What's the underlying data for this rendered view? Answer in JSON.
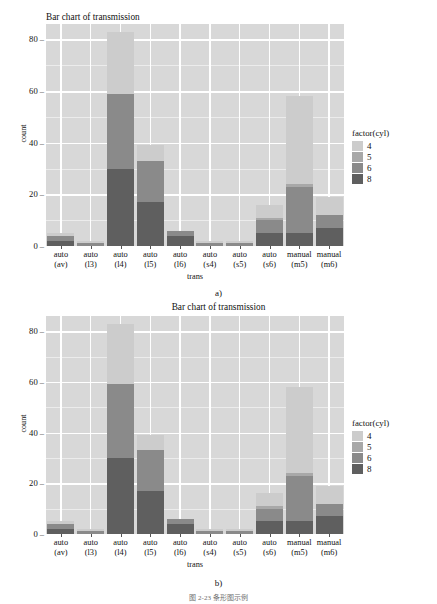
{
  "figure": {
    "panel_a_label": "a)",
    "panel_b_label": "b)",
    "caption": "图 2-23  条形图示例"
  },
  "colors": {
    "panel_background": "#d8d8d8",
    "gridline_major": "#ffffff",
    "gridline_minor": "#ececec",
    "cyl_4": "#cccccc",
    "cyl_5": "#a8a8a8",
    "cyl_6": "#8a8a8a",
    "cyl_8": "#5f5f5f",
    "text": "#111111"
  },
  "chart_data": [
    {
      "type": "bar",
      "id": "chart-a",
      "title": "Bar chart of transmission",
      "title_align": "left",
      "xlabel": "trans",
      "ylabel": "count",
      "ylim": [
        0,
        86
      ],
      "yticks": [
        0,
        20,
        40,
        60,
        80
      ],
      "ytick_labels": [
        "0",
        "20",
        "40",
        "60",
        "80"
      ],
      "grid": true,
      "stacked": true,
      "legend_title": "factor(cyl)",
      "legend_position": "right",
      "categories": [
        "auto\n(av)",
        "auto\n(l3)",
        "auto\n(l4)",
        "auto\n(l5)",
        "auto\n(l6)",
        "auto\n(s4)",
        "auto\n(s5)",
        "auto\n(s6)",
        "manual\n(m5)",
        "manual\n(m6)"
      ],
      "category_labels": [
        {
          "line1": "auto",
          "line2": "(av)"
        },
        {
          "line1": "auto",
          "line2": "(l3)"
        },
        {
          "line1": "auto",
          "line2": "(l4)"
        },
        {
          "line1": "auto",
          "line2": "(l5)"
        },
        {
          "line1": "auto",
          "line2": "(l6)"
        },
        {
          "line1": "auto",
          "line2": "(s4)"
        },
        {
          "line1": "auto",
          "line2": "(s5)"
        },
        {
          "line1": "auto",
          "line2": "(s6)"
        },
        {
          "line1": "manual",
          "line2": "(m5)"
        },
        {
          "line1": "manual",
          "line2": "(m6)"
        }
      ],
      "series": [
        {
          "name": "8",
          "color": "#5f5f5f",
          "values": [
            2,
            0,
            30,
            17,
            4,
            0,
            0,
            5,
            5,
            7
          ]
        },
        {
          "name": "6",
          "color": "#8a8a8a",
          "values": [
            2,
            1,
            29,
            16,
            2,
            1,
            1,
            5,
            18,
            5
          ]
        },
        {
          "name": "5",
          "color": "#a8a8a8",
          "values": [
            0,
            0,
            0,
            0,
            0,
            0,
            0,
            1,
            1,
            0
          ]
        },
        {
          "name": "4",
          "color": "#cccccc",
          "values": [
            1,
            1,
            24,
            6,
            0,
            1,
            1,
            5,
            34,
            7
          ]
        }
      ],
      "totals": [
        5,
        2,
        83,
        39,
        6,
        2,
        2,
        16,
        58,
        19
      ]
    },
    {
      "type": "bar",
      "id": "chart-b",
      "title": "Bar chart of transmission",
      "title_align": "center",
      "xlabel": "trans",
      "ylabel": "count",
      "ylim": [
        0,
        86
      ],
      "yticks": [
        0,
        20,
        40,
        60,
        80
      ],
      "ytick_labels": [
        "0",
        "20",
        "40",
        "60",
        "80"
      ],
      "grid": true,
      "stacked": true,
      "legend_title": "factor(cyl)",
      "legend_position": "right",
      "categories": [
        "auto\n(av)",
        "auto\n(l3)",
        "auto\n(l4)",
        "auto\n(l5)",
        "auto\n(l6)",
        "auto\n(s4)",
        "auto\n(s5)",
        "auto\n(s6)",
        "manual\n(m5)",
        "manual\n(m6)"
      ],
      "category_labels": [
        {
          "line1": "auto",
          "line2": "(av)"
        },
        {
          "line1": "auto",
          "line2": "(l3)"
        },
        {
          "line1": "auto",
          "line2": "(l4)"
        },
        {
          "line1": "auto",
          "line2": "(l5)"
        },
        {
          "line1": "auto",
          "line2": "(l6)"
        },
        {
          "line1": "auto",
          "line2": "(s4)"
        },
        {
          "line1": "auto",
          "line2": "(s5)"
        },
        {
          "line1": "auto",
          "line2": "(s6)"
        },
        {
          "line1": "manual",
          "line2": "(m5)"
        },
        {
          "line1": "manual",
          "line2": "(m6)"
        }
      ],
      "series": [
        {
          "name": "8",
          "color": "#5f5f5f",
          "values": [
            2,
            0,
            30,
            17,
            4,
            0,
            0,
            5,
            5,
            7
          ]
        },
        {
          "name": "6",
          "color": "#8a8a8a",
          "values": [
            2,
            1,
            29,
            16,
            2,
            1,
            1,
            5,
            18,
            5
          ]
        },
        {
          "name": "5",
          "color": "#a8a8a8",
          "values": [
            0,
            0,
            0,
            0,
            0,
            0,
            0,
            1,
            1,
            0
          ]
        },
        {
          "name": "4",
          "color": "#cccccc",
          "values": [
            1,
            1,
            24,
            6,
            0,
            1,
            1,
            5,
            34,
            7
          ]
        }
      ],
      "totals": [
        5,
        2,
        83,
        39,
        6,
        2,
        2,
        16,
        58,
        19
      ]
    }
  ]
}
